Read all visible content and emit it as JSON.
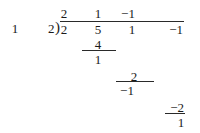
{
  "division": {
    "row_label": "1",
    "divisor": "2",
    "quotient": [
      "2",
      "1",
      "−1"
    ],
    "dividend": [
      "2",
      "5",
      "1",
      "−1"
    ],
    "steps": [
      {
        "product": "4",
        "remainder": "1"
      },
      {
        "product": "2",
        "remainder": "−1"
      },
      {
        "product": "−2",
        "remainder": "1"
      }
    ]
  }
}
